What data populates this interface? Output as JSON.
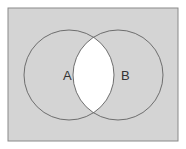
{
  "diagram": {
    "type": "venn",
    "universe": {
      "x": 8,
      "y": 8,
      "width": 170,
      "height": 133,
      "fill": "#d4d4d4",
      "stroke": "#8a8a8a"
    },
    "sets": [
      {
        "label": "A",
        "cx": 69,
        "cy": 75,
        "r": 45
      },
      {
        "label": "B",
        "cx": 118,
        "cy": 75,
        "r": 45
      }
    ],
    "shaded_region": "intersection A∩B (white)",
    "colors": {
      "background": "#d4d4d4",
      "intersection": "#ffffff",
      "circle_stroke": "#6e6e6e"
    }
  }
}
